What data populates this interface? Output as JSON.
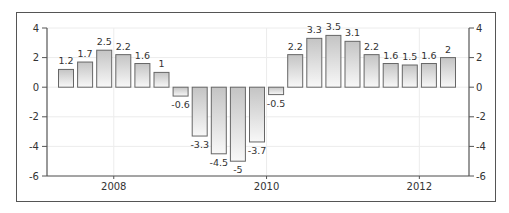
{
  "chart_data": {
    "type": "bar",
    "title": "",
    "xlabel": "",
    "ylabel": "",
    "ylim": [
      -6,
      4
    ],
    "yticks": [
      4,
      2,
      0,
      -2,
      -4,
      -6
    ],
    "xtick_labels": [
      {
        "label": "2008",
        "index": 2.5
      },
      {
        "label": "2010",
        "index": 10.5
      },
      {
        "label": "2012",
        "index": 18.5
      }
    ],
    "grid": true,
    "legend": null,
    "values": [
      1.2,
      1.7,
      2.5,
      2.2,
      1.6,
      1,
      -0.6,
      -3.3,
      -4.5,
      -5,
      -3.7,
      -0.5,
      2.2,
      3.3,
      3.5,
      3.1,
      2.2,
      1.6,
      1.5,
      1.6,
      2
    ],
    "data_labels": [
      "1.2",
      "1.7",
      "2.5",
      "2.2",
      "1.6",
      "1",
      "-0.6",
      "-3.3",
      "-4.5",
      "-5",
      "-3.7",
      "-0.5",
      "2.2",
      "3.3",
      "3.5",
      "3.1",
      "2.2",
      "1.6",
      "1.5",
      "1.6",
      "2"
    ],
    "dual_y_axis": true
  },
  "colors": {
    "bar_top": "#c8c8c8",
    "bar_bottom": "#f7f7f7",
    "bar_stroke": "#666666",
    "axis": "#555555",
    "grid": "#ececec",
    "frame": "#555555"
  }
}
